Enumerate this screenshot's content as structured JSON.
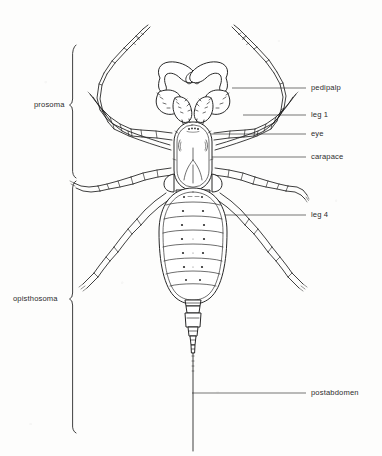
{
  "figure": {
    "background_color": "#fdfdfc",
    "ink_color": "#1a1a1a",
    "label_color": "#2c2c2c"
  },
  "region_labels": [
    {
      "id": "prosoma",
      "text": "prosoma",
      "x": 34,
      "y": 101,
      "bracket_top": 45,
      "bracket_bottom": 177,
      "tick_y": 105
    },
    {
      "id": "opisthosoma",
      "text": "opisthosoma",
      "x": 13,
      "y": 295,
      "bracket_top": 181,
      "bracket_bottom": 433,
      "tick_y": 299
    }
  ],
  "part_labels": [
    {
      "id": "pedipalp",
      "text": "pedipalp",
      "x": 311,
      "y": 84,
      "leader_x1": 232,
      "leader_y1": 88,
      "leader_x2": 306,
      "leader_y2": 88
    },
    {
      "id": "leg-1",
      "text": "leg 1",
      "x": 311,
      "y": 111,
      "leader_x1": 243,
      "leader_y1": 115,
      "leader_x2": 306,
      "leader_y2": 115
    },
    {
      "id": "eye",
      "text": "eye",
      "x": 311,
      "y": 130,
      "leader_x1": 196,
      "leader_y1": 134,
      "leader_x2": 306,
      "leader_y2": 134
    },
    {
      "id": "carapace",
      "text": "carapace",
      "x": 311,
      "y": 153,
      "leader_x1": 196,
      "leader_y1": 157,
      "leader_x2": 306,
      "leader_y2": 157
    },
    {
      "id": "leg-4",
      "text": "leg 4",
      "x": 311,
      "y": 211,
      "leader_x1": 220,
      "leader_y1": 215,
      "leader_x2": 306,
      "leader_y2": 215
    },
    {
      "id": "postabdomen",
      "text": "postabdomen",
      "x": 311,
      "y": 389,
      "leader_x1": 192,
      "leader_y1": 393,
      "leader_x2": 306,
      "leader_y2": 393
    }
  ],
  "anatomy": {
    "carapace": {
      "cx": 193,
      "cy": 155,
      "rx": 20,
      "ry": 34,
      "segments": 0
    },
    "opisthosoma": {
      "cx": 193,
      "cy": 245,
      "rx": 34,
      "ry": 59,
      "segment_count": 8
    },
    "postabdomen": {
      "x": 193,
      "top": 300,
      "bottom": 340,
      "segment_count": 4
    },
    "flagellum": {
      "x": 193,
      "top": 340,
      "bottom": 451
    },
    "pedipalp_count": 2,
    "leg_pairs": 4
  }
}
